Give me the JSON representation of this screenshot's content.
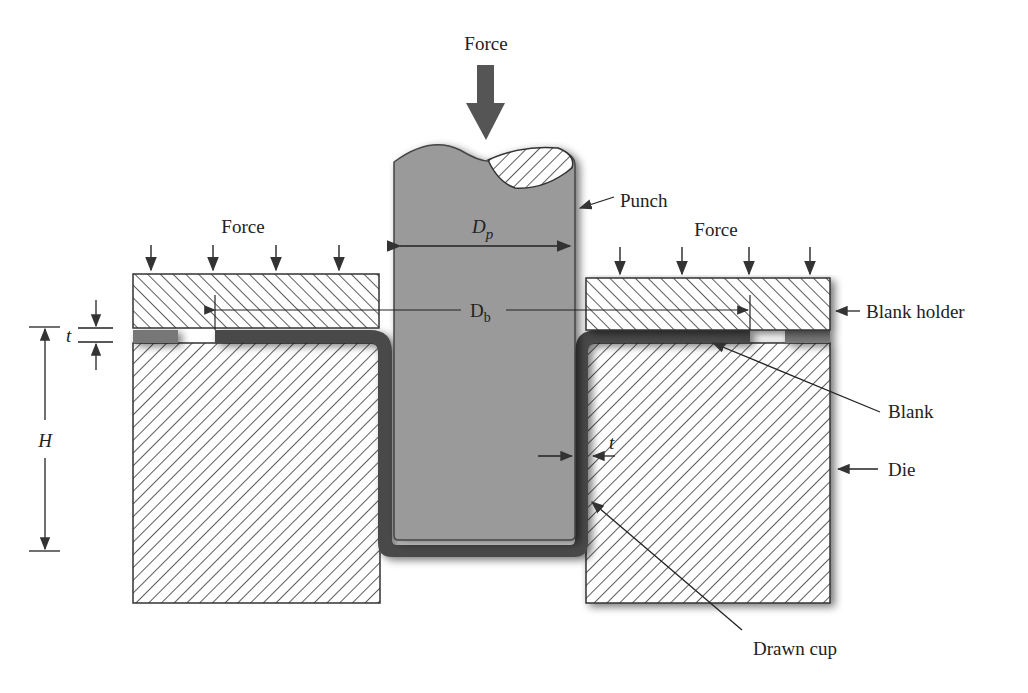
{
  "diagram": {
    "labels": {
      "force_top": "Force",
      "force_left": "Force",
      "force_right": "Force",
      "punch": "Punch",
      "punch_diameter": "D",
      "punch_diameter_sub": "p",
      "blank_diameter": "D",
      "blank_diameter_sub": "b",
      "blank_holder": "Blank holder",
      "blank": "Blank",
      "die": "Die",
      "drawn_cup": "Drawn cup",
      "thickness_left": "t",
      "thickness_wall": "t",
      "height": "H"
    },
    "colors": {
      "punch_fill": "#9a9a9a",
      "blank_fill": "#4a4a4a",
      "hatch_line": "#333333",
      "arrow": "#333333",
      "background": "#ffffff"
    }
  }
}
